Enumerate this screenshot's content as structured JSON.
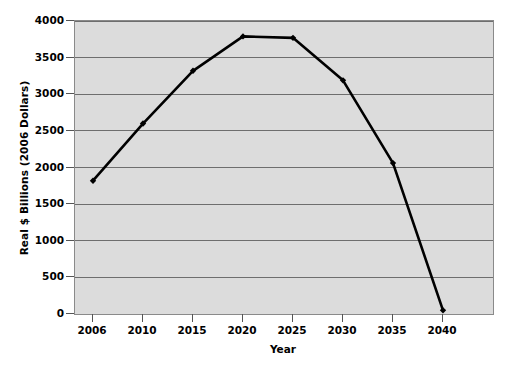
{
  "chart_data": {
    "type": "line",
    "title": "",
    "subtitle": "",
    "xlabel": "Year",
    "ylabel": "Real $ Billions (2006 Dollars)",
    "categories": [
      "2006",
      "2010",
      "2015",
      "2020",
      "2025",
      "2030",
      "2035",
      "2040"
    ],
    "values": [
      1820,
      2600,
      3320,
      3790,
      3770,
      3190,
      2060,
      50
    ],
    "series": [
      {
        "name": "Real $ Billions (2006 Dollars)",
        "values": [
          1820,
          2600,
          3320,
          3790,
          3770,
          3190,
          2060,
          50
        ]
      }
    ],
    "ylim": [
      0,
      4000
    ],
    "yticks": [
      0,
      500,
      1000,
      1500,
      2000,
      2500,
      3000,
      3500,
      4000
    ],
    "ytick_labels": [
      "0",
      "500",
      "1000",
      "1500",
      "2000",
      "2500",
      "3000",
      "3500",
      "4000"
    ],
    "xtick_labels": [
      "2006",
      "2010",
      "2015",
      "2020",
      "2025",
      "2030",
      "2035",
      "2040"
    ],
    "grid": "horizontal",
    "legend": "none",
    "annotations": [],
    "colors": {
      "line": "#000000",
      "marker": "#000000",
      "plot_background": "#dcdcdc",
      "gridline": "#6e6e6e",
      "axis": "#8a8a8a",
      "text": "#000000",
      "figure_background": "#ffffff"
    }
  }
}
